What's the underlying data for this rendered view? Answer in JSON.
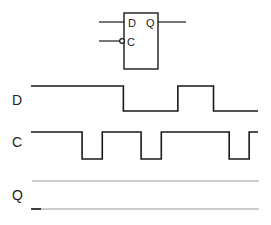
{
  "flipflop": {
    "input_d_label": "D",
    "input_c_label": "C",
    "output_q_label": "Q",
    "clock_inverted": true
  },
  "signals": [
    {
      "name": "D",
      "initial": 1,
      "transitions": [
        0.407,
        0.647,
        0.804
      ],
      "end": 1.0
    },
    {
      "name": "C",
      "initial": 1,
      "transitions": [
        0.225,
        0.314,
        0.485,
        0.574,
        0.873,
        0.961
      ],
      "end": 1.0
    },
    {
      "name": "Q",
      "initial": 0,
      "transitions": [],
      "end": 0.044,
      "undetermined": true
    }
  ],
  "labels": {
    "d": "D",
    "c": "C",
    "q": "Q"
  }
}
